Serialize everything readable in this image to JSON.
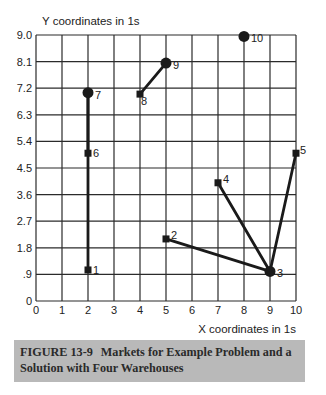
{
  "chart_data": {
    "type": "scatter",
    "title": "",
    "xlabel": "X coordinates in 1s",
    "ylabel": "Y coordinates in 1s",
    "xlim": [
      0,
      10
    ],
    "ylim": [
      0,
      9.0
    ],
    "grid": true,
    "x_ticks": [
      "0",
      "1",
      "2",
      "3",
      "4",
      "5",
      "6",
      "7",
      "8",
      "9",
      "10"
    ],
    "y_ticks": [
      "0",
      ".9",
      "1.8",
      "2.7",
      "3.6",
      "4.5",
      "5.4",
      "6.3",
      "7.2",
      "8.1",
      "9.0"
    ],
    "y_tick_values": [
      0,
      0.9,
      1.8,
      2.7,
      3.6,
      4.5,
      5.4,
      6.3,
      7.2,
      8.1,
      9.0
    ],
    "markets": [
      {
        "id": "1",
        "x": 2,
        "y": 1.05,
        "marker": "square"
      },
      {
        "id": "2",
        "x": 5,
        "y": 2.1,
        "marker": "square"
      },
      {
        "id": "3",
        "x": 9,
        "y": 1.0,
        "marker": "warehouse"
      },
      {
        "id": "4",
        "x": 7,
        "y": 4.0,
        "marker": "square"
      },
      {
        "id": "5",
        "x": 10,
        "y": 5.0,
        "marker": "square"
      },
      {
        "id": "6",
        "x": 2,
        "y": 5.0,
        "marker": "square"
      },
      {
        "id": "7",
        "x": 2,
        "y": 7.05,
        "marker": "warehouse"
      },
      {
        "id": "8",
        "x": 4,
        "y": 7.0,
        "marker": "square"
      },
      {
        "id": "9",
        "x": 5,
        "y": 8.05,
        "marker": "warehouse"
      },
      {
        "id": "10",
        "x": 8,
        "y": 8.95,
        "marker": "warehouse"
      }
    ],
    "warehouses": [
      "3",
      "7",
      "9",
      "10"
    ],
    "assignments": [
      {
        "from": "7",
        "to": "1"
      },
      {
        "from": "7",
        "to": "6"
      },
      {
        "from": "9",
        "to": "8"
      },
      {
        "from": "3",
        "to": "2"
      },
      {
        "from": "3",
        "to": "4"
      },
      {
        "from": "3",
        "to": "5"
      }
    ]
  },
  "caption": {
    "figure_label": "FIGURE 13-9",
    "text": "Markets for Example Problem and a Solution with Four Warehouses"
  },
  "colors": {
    "ink": "#1a1a1a",
    "grid": "#2b2b2b",
    "caption_bg": "#b9b9b9"
  }
}
